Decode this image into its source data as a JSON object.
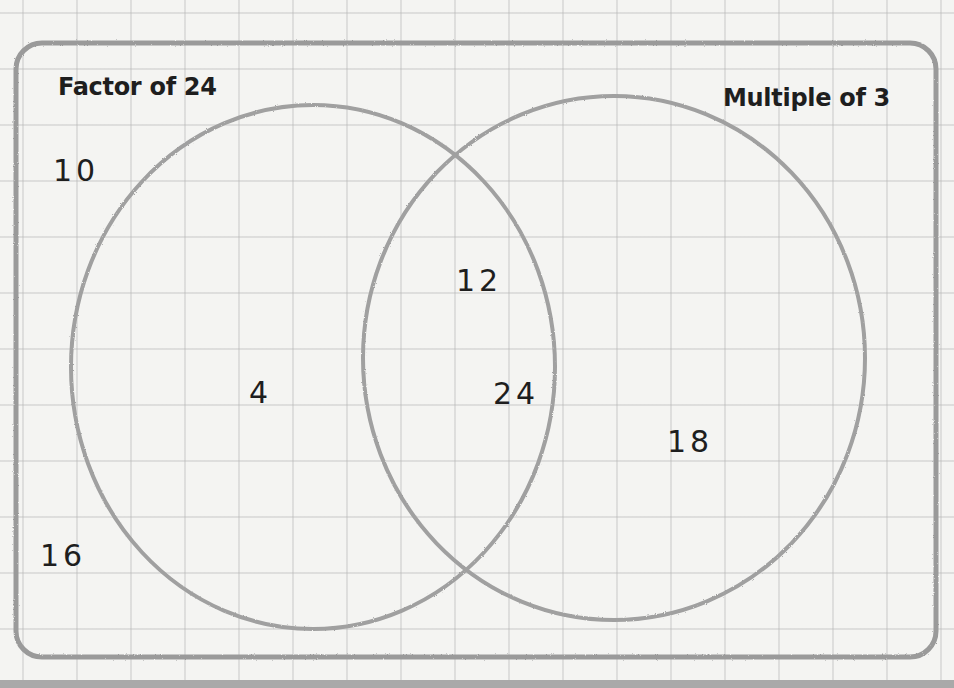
{
  "diagram": {
    "type": "venn",
    "universe_frame": "rounded-rectangle",
    "sets": [
      {
        "id": "left",
        "title": "Factor of 24"
      },
      {
        "id": "right",
        "title": "Multiple of 3"
      }
    ],
    "regions": {
      "outside": [
        "10",
        "16"
      ],
      "left_only": [
        "4"
      ],
      "intersection": [
        "12",
        "24"
      ],
      "right_only": [
        "18"
      ]
    },
    "colors": {
      "stroke": "#9a9a9a",
      "text": "#1e1e1e",
      "grid": "#d0d0d0",
      "paper": "#f4f4f2"
    }
  }
}
